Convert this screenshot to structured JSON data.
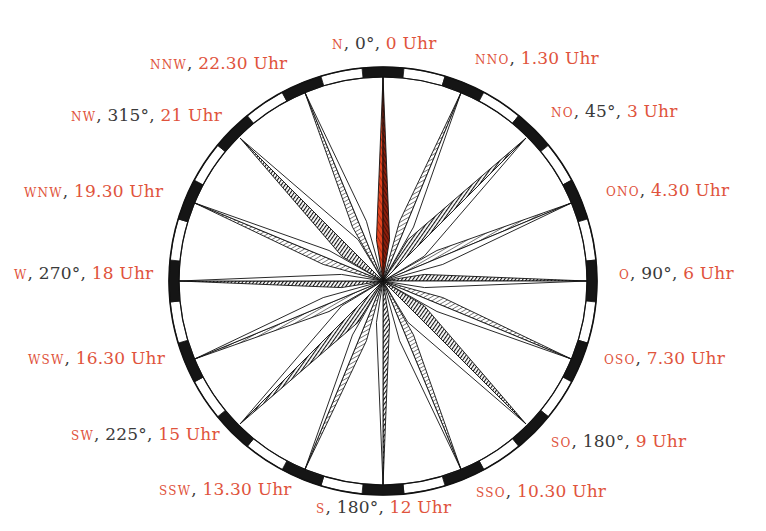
{
  "diagram": {
    "colors": {
      "label_accent": "#e0533c",
      "label_text": "#3a3a3a",
      "north_point": "#d83a1f",
      "ink": "#111111"
    },
    "center": [
      383,
      281
    ],
    "outer_radius": 214,
    "ring_width": 10,
    "ring_segments": 32
  },
  "labels": [
    {
      "id": "n",
      "abbr": "N",
      "deg": "0°",
      "time": "0 Uhr",
      "x": 332,
      "y": 33
    },
    {
      "id": "nno",
      "abbr": "NNO",
      "deg": "",
      "time": "1.30 Uhr",
      "x": 475,
      "y": 48
    },
    {
      "id": "no",
      "abbr": "NO",
      "deg": "45°",
      "time": "3 Uhr",
      "x": 551,
      "y": 101
    },
    {
      "id": "ono",
      "abbr": "ONO",
      "deg": "",
      "time": "4.30 Uhr",
      "x": 606,
      "y": 180
    },
    {
      "id": "o",
      "abbr": "O",
      "deg": "90°",
      "time": "6 Uhr",
      "x": 619,
      "y": 263
    },
    {
      "id": "oso",
      "abbr": "OSO",
      "deg": "",
      "time": "7.30 Uhr",
      "x": 604,
      "y": 348
    },
    {
      "id": "so",
      "abbr": "SO",
      "deg": "180°",
      "time": "9 Uhr",
      "x": 551,
      "y": 431
    },
    {
      "id": "sso",
      "abbr": "SSO",
      "deg": "",
      "time": "10.30 Uhr",
      "x": 476,
      "y": 481
    },
    {
      "id": "s",
      "abbr": "S",
      "deg": "180°",
      "time": "12 Uhr",
      "x": 316,
      "y": 497
    },
    {
      "id": "ssw",
      "abbr": "SSW",
      "deg": "",
      "time": "13.30 Uhr",
      "x": 159,
      "y": 479
    },
    {
      "id": "sw",
      "abbr": "SW",
      "deg": "225°",
      "time": "15 Uhr",
      "x": 71,
      "y": 424
    },
    {
      "id": "wsw",
      "abbr": "WSW",
      "deg": "",
      "time": "16.30 Uhr",
      "x": 28,
      "y": 348
    },
    {
      "id": "w",
      "abbr": "W",
      "deg": "270°",
      "time": "18 Uhr",
      "x": 14,
      "y": 263
    },
    {
      "id": "wnw",
      "abbr": "WNW",
      "deg": "",
      "time": "19.30 Uhr",
      "x": 24,
      "y": 181
    },
    {
      "id": "nw",
      "abbr": "NW",
      "deg": "315°",
      "time": "21 Uhr",
      "x": 71,
      "y": 105
    },
    {
      "id": "nnw",
      "abbr": "NNW",
      "deg": "",
      "time": "22.30 Uhr",
      "x": 150,
      "y": 53
    }
  ]
}
